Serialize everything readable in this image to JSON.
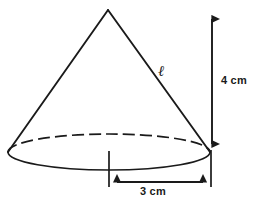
{
  "figure": {
    "shape": "cone",
    "stroke_color": "#1a1a1a",
    "background_color": "#ffffff"
  },
  "labels": {
    "height": "4 cm",
    "radius": "3 cm",
    "slant_height": "ℓ"
  },
  "measurements": {
    "height_value": "4",
    "height_unit": "cm",
    "radius_value": "3",
    "radius_unit": "cm",
    "slant_symbol": "ℓ"
  },
  "geometry": {
    "apex_x": 108,
    "apex_y": 10,
    "base_center_x": 109,
    "base_center_y": 152,
    "base_rx": 101,
    "base_ry": 18,
    "height_arrow_x": 212,
    "height_arrow_top_y": 11,
    "height_arrow_bottom_y": 152,
    "radius_arrow_y": 182,
    "radius_arrow_left_x": 109,
    "radius_arrow_right_x": 211
  }
}
